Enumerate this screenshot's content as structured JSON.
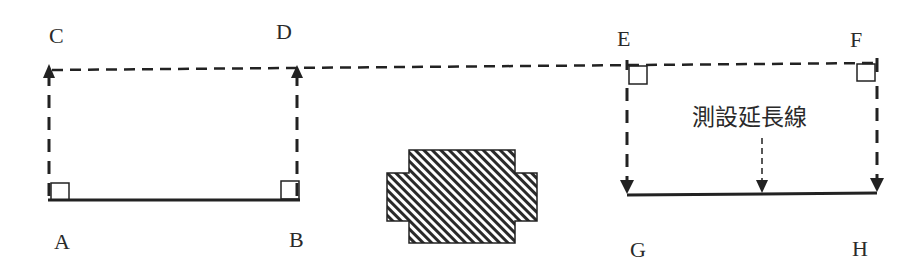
{
  "diagram": {
    "points": {
      "A": "A",
      "B": "B",
      "C": "C",
      "D": "D",
      "E": "E",
      "F": "F",
      "G": "G",
      "H": "H"
    },
    "annotation": "測設延長線",
    "colors": {
      "line": "#222222",
      "background": "#ffffff",
      "hatch": "#2a2a2a"
    }
  }
}
